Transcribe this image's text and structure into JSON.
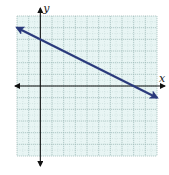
{
  "chart_data": {
    "type": "line",
    "title": "",
    "xlabel": "x",
    "ylabel": "y",
    "xlim": [
      -2,
      10
    ],
    "ylim": [
      -6,
      6
    ],
    "grid": true,
    "tick_labels_shown": false,
    "series": [
      {
        "name": "line",
        "equation": "y = -0.5x + 4",
        "slope": -0.5,
        "intercept": 4,
        "x": [
          -2,
          0,
          8,
          10
        ],
        "y": [
          5,
          4,
          0,
          -1
        ],
        "arrows_both_ends": true,
        "color": "#2b3a7c"
      }
    ]
  },
  "colors": {
    "grid_background": "#e8f5f4",
    "grid_line": "#9cb9b6",
    "axis": "#111111",
    "line": "#2b3a7c"
  }
}
